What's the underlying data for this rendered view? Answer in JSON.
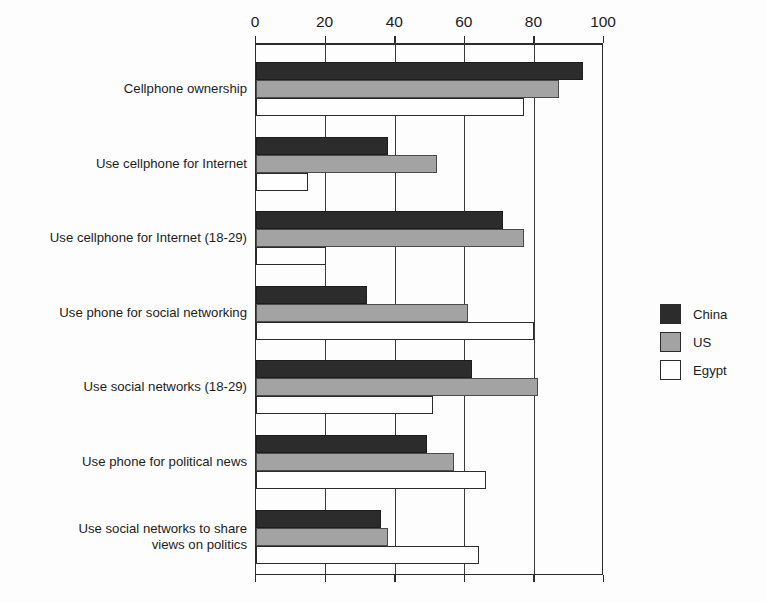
{
  "chart_data": {
    "type": "bar",
    "orientation": "horizontal",
    "title": "",
    "subtitle": "",
    "xlabel": "",
    "ylabel": "",
    "xlim": [
      0,
      100
    ],
    "ylim": null,
    "grid": true,
    "grid_axis": "x",
    "axis_position": "top",
    "legend_position": "right",
    "tick_labels": [
      "0",
      "20",
      "40",
      "60",
      "80",
      "100"
    ],
    "ticks": [
      0,
      20,
      40,
      60,
      80,
      100
    ],
    "categories": [
      "Cellphone ownership",
      "Use cellphone for Internet",
      "Use cellphone for Internet (18-29)",
      "Use phone for social networking",
      "Use social networks (18-29)",
      "Use phone for political news",
      "Use social networks to share\nviews on politics"
    ],
    "series": [
      {
        "name": "China",
        "color": "#2c2c2c",
        "values": [
          94,
          38,
          71,
          32,
          62,
          49,
          36
        ]
      },
      {
        "name": "US",
        "color": "#a3a3a3",
        "values": [
          87,
          52,
          77,
          61,
          81,
          57,
          38
        ]
      },
      {
        "name": "Egypt",
        "color": "#ffffff",
        "values": [
          77,
          15,
          20,
          80,
          51,
          66,
          64
        ]
      }
    ]
  },
  "legend": {
    "entries": [
      {
        "label": "China",
        "swatch": "china"
      },
      {
        "label": "US",
        "swatch": "us"
      },
      {
        "label": "Egypt",
        "swatch": "egypt"
      }
    ]
  },
  "colors": {
    "background": "#fdfdfd",
    "axis": "#2b2b2b",
    "text": "#1c1c1c",
    "china": "#2c2c2c",
    "us": "#a3a3a3",
    "egypt": "#ffffff"
  }
}
